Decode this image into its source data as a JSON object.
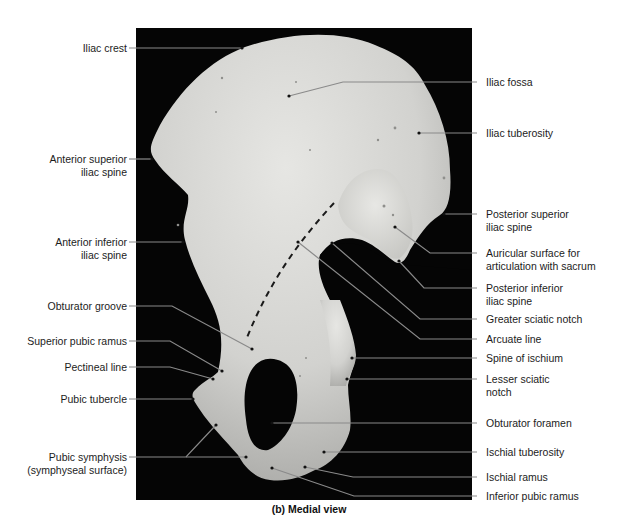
{
  "figure": {
    "caption": "(b) Medial view",
    "background_color": "#ffffff",
    "panel_color": "#050505",
    "bone_color": "#d9d9d6",
    "leader_color": "#8a8a8a"
  },
  "labels": {
    "left": [
      {
        "id": "iliac-crest",
        "lines": [
          "Iliac crest"
        ]
      },
      {
        "id": "anterior-superior-iliac-spine",
        "lines": [
          "Anterior superior",
          "iliac spine"
        ]
      },
      {
        "id": "anterior-inferior-iliac-spine",
        "lines": [
          "Anterior inferior",
          "iliac spine"
        ]
      },
      {
        "id": "obturator-groove",
        "lines": [
          "Obturator groove"
        ]
      },
      {
        "id": "superior-pubic-ramus",
        "lines": [
          "Superior pubic ramus"
        ]
      },
      {
        "id": "pectineal-line",
        "lines": [
          "Pectineal line"
        ]
      },
      {
        "id": "pubic-tubercle",
        "lines": [
          "Pubic tubercle"
        ]
      },
      {
        "id": "pubic-symphysis",
        "lines": [
          "Pubic symphysis",
          "(symphyseal surface)"
        ]
      }
    ],
    "right": [
      {
        "id": "iliac-fossa",
        "lines": [
          "Iliac fossa"
        ]
      },
      {
        "id": "iliac-tuberosity",
        "lines": [
          "Iliac tuberosity"
        ]
      },
      {
        "id": "posterior-superior-iliac-spine",
        "lines": [
          "Posterior superior",
          "iliac spine"
        ]
      },
      {
        "id": "auricular-surface",
        "lines": [
          "Auricular surface for",
          "articulation with sacrum"
        ]
      },
      {
        "id": "posterior-inferior-iliac-spine",
        "lines": [
          "Posterior inferior",
          "iliac spine"
        ]
      },
      {
        "id": "greater-sciatic-notch",
        "lines": [
          "Greater sciatic notch"
        ]
      },
      {
        "id": "arcuate-line",
        "lines": [
          "Arcuate line"
        ]
      },
      {
        "id": "spine-of-ischium",
        "lines": [
          "Spine of ischium"
        ]
      },
      {
        "id": "lesser-sciatic-notch",
        "lines": [
          "Lesser sciatic",
          "notch"
        ]
      },
      {
        "id": "obturator-foramen",
        "lines": [
          "Obturator foramen"
        ]
      },
      {
        "id": "ischial-tuberosity",
        "lines": [
          "Ischial tuberosity"
        ]
      },
      {
        "id": "ischial-ramus",
        "lines": [
          "Ischial ramus"
        ]
      },
      {
        "id": "inferior-pubic-ramus",
        "lines": [
          "Inferior pubic ramus"
        ]
      }
    ]
  }
}
